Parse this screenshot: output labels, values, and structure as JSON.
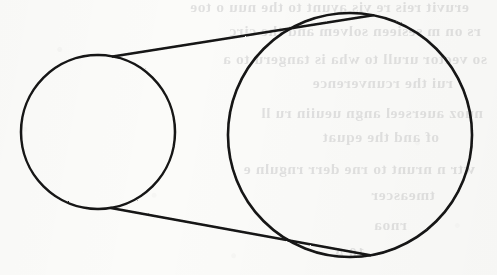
{
  "page": {
    "kind": "scanned-textbook-figure",
    "width": 497,
    "height": 275,
    "paper_color": "#fbfbf9",
    "ink_color": "#141414"
  },
  "figure": {
    "name": "two-circles-with-external-tangents",
    "stroke_color": "#141414",
    "stroke_width": 2.6,
    "fill": "none",
    "shapes": [
      {
        "id": "small-circle",
        "type": "circle",
        "cx": 98,
        "cy": 132,
        "r": 77
      },
      {
        "id": "large-circle",
        "type": "circle",
        "cx": 350,
        "cy": 135,
        "r": 122
      },
      {
        "id": "upper-tangent",
        "type": "line",
        "x1": 84.2,
        "y1": 55.3,
        "x2": 328.1,
        "y2": 14.0
      },
      {
        "id": "lower-tangent",
        "type": "line",
        "x1": 90.1,
        "y1": 208.6,
        "x2": 337.5,
        "y2": 254.8
      }
    ]
  },
  "bleed_through": {
    "note": "Faint mirror-image ink showing through from the reverse page; not legible.",
    "opacity": 0.115,
    "lines": [
      {
        "top": -2,
        "left": 28,
        "text": "eruvit reis re vis ayunt to the nuu o toe"
      },
      {
        "top": 22,
        "left": 16,
        "text": "rs on m sesieen solvem   and the circ"
      },
      {
        "top": 50,
        "left": 10,
        "text": "so vector urull to wha is tangeru to a"
      },
      {
        "top": 74,
        "left": 44,
        "text": "rui  the  rcunverence"
      },
      {
        "top": 104,
        "left": 14,
        "text": "nuoz auerseel  angn ueuiin  ru ll"
      },
      {
        "top": 128,
        "left": 58,
        "text": "of  and the equat"
      },
      {
        "top": 160,
        "left": 22,
        "text": "wtr  n  nrunt  to   rne  derr  rnguln e"
      },
      {
        "top": 186,
        "left": 62,
        "text": "tmeascer"
      },
      {
        "top": 216,
        "left": 90,
        "text": "rnoa"
      },
      {
        "top": 244,
        "left": 132,
        "text": "10   A"
      }
    ]
  }
}
